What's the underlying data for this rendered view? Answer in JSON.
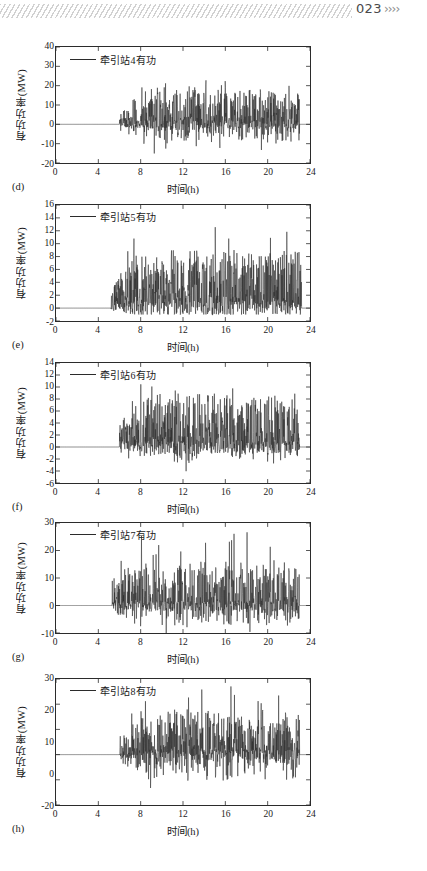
{
  "page": {
    "folio": "023",
    "chevrons": "››››",
    "hatch_name": "decorative-hatch-band"
  },
  "figure": {
    "xlabel": "时间(h)",
    "ylabel": "有功功率(MW)",
    "xticks": [
      "0",
      "4",
      "8",
      "12",
      "16",
      "20",
      "24"
    ],
    "panels": [
      {
        "tag": "(d)",
        "legend": "牵引站4有功",
        "yticks": [
          "40",
          "30",
          "20",
          "10",
          "0",
          "-10",
          "-20"
        ]
      },
      {
        "tag": "(e)",
        "legend": "牵引站5有功",
        "yticks": [
          "16",
          "14",
          "12",
          "10",
          "8",
          "6",
          "4",
          "2",
          "0",
          "-2"
        ]
      },
      {
        "tag": "(f)",
        "legend": "牵引站6有功",
        "yticks": [
          "14",
          "12",
          "10",
          "8",
          "6",
          "4",
          "2",
          "0",
          "-2",
          "-4",
          "-6"
        ]
      },
      {
        "tag": "(g)",
        "legend": "牵引站7有功",
        "yticks": [
          "30",
          "20",
          "10",
          "0",
          "-10"
        ]
      },
      {
        "tag": "(h)",
        "legend": "牵引站8有功",
        "yticks": [
          "30",
          "20",
          "10",
          "0",
          "-20"
        ]
      }
    ]
  },
  "chart_data": [
    {
      "type": "line",
      "id": "panel-d",
      "title": "",
      "label": "(d)",
      "xlabel": "时间(h)",
      "ylabel": "有功功率(MW)",
      "legend": [
        "牵引站4有功"
      ],
      "legend_position": "top-left-inside",
      "grid": false,
      "xlim": [
        0,
        24
      ],
      "ylim": [
        -20,
        40
      ],
      "xticks": [
        0,
        4,
        8,
        12,
        16,
        20,
        24
      ],
      "yticks": [
        -20,
        -10,
        0,
        10,
        20,
        30,
        40
      ],
      "series": [
        {
          "name": "牵引站4有功",
          "color": "#2b2b2b",
          "note": "Flat at 0 MW from 0h to ~6h; bursty traction load 6h-23h; peaks ~28 MW near 9.5h and ~25 MW near 12.3h; troughs to about -17 MW; returns to ~0 after 23h",
          "quiet_interval": [
            0,
            6
          ],
          "active_interval": [
            6,
            23
          ],
          "peak_value": 28,
          "min_value": -17,
          "typical_band": [
            -10,
            20
          ]
        }
      ]
    },
    {
      "type": "line",
      "id": "panel-e",
      "title": "",
      "label": "(e)",
      "xlabel": "时间(h)",
      "ylabel": "有功功率(MW)",
      "legend": [
        "牵引站5有功"
      ],
      "legend_position": "top-left-inside",
      "grid": false,
      "xlim": [
        0,
        24
      ],
      "ylim": [
        -2,
        16
      ],
      "xticks": [
        0,
        4,
        8,
        12,
        16,
        20,
        24
      ],
      "yticks": [
        -2,
        0,
        2,
        4,
        6,
        8,
        10,
        12,
        14,
        16
      ],
      "series": [
        {
          "name": "牵引站5有功",
          "color": "#2b2b2b",
          "note": "Flat at 0 MW until ~5.2h; isolated spikes 5-8h reaching 4-6 MW; dense activity 8.5h-23h; maxima ~14.2 MW near 11.5h and ~14.2 MW near 22h; mostly positive, minimum near -1 MW",
          "quiet_interval": [
            0,
            5.2
          ],
          "active_interval": [
            5.2,
            23.2
          ],
          "peak_value": 14.2,
          "min_value": -1,
          "typical_band": [
            0,
            10
          ]
        }
      ]
    },
    {
      "type": "line",
      "id": "panel-f",
      "title": "",
      "label": "(f)",
      "xlabel": "时间(h)",
      "ylabel": "有功功率(MW)",
      "legend": [
        "牵引站6有功"
      ],
      "legend_position": "top-left-inside",
      "grid": false,
      "xlim": [
        0,
        24
      ],
      "ylim": [
        -6,
        14
      ],
      "xticks": [
        0,
        4,
        8,
        12,
        16,
        20,
        24
      ],
      "yticks": [
        -6,
        -4,
        -2,
        0,
        2,
        4,
        6,
        8,
        10,
        12,
        14
      ],
      "series": [
        {
          "name": "牵引站6有功",
          "color": "#2b2b2b",
          "note": "Flat at 0 MW until ~6h; small bumps 6-8h up to ~4.5 MW; heavy fluctuation 8.5h-23h; peak ~13 MW near 12.6h; deepest trough about -4.5 MW near 15h",
          "quiet_interval": [
            0,
            6
          ],
          "active_interval": [
            6,
            23
          ],
          "peak_value": 13,
          "min_value": -4.5,
          "typical_band": [
            -2,
            10
          ]
        }
      ]
    },
    {
      "type": "line",
      "id": "panel-g",
      "title": "",
      "label": "(g)",
      "xlabel": "时间(h)",
      "ylabel": "有功功率(MW)",
      "legend": [
        "牵引站7有功"
      ],
      "legend_position": "top-left-inside",
      "grid": false,
      "xlim": [
        0,
        24
      ],
      "ylim": [
        -10,
        30
      ],
      "xticks": [
        0,
        4,
        8,
        12,
        16,
        20,
        24
      ],
      "yticks": [
        -10,
        0,
        10,
        20,
        30
      ],
      "series": [
        {
          "name": "牵引站7有功",
          "color": "#2b2b2b",
          "note": "Flat at 0 MW until ~5.3h; isolated spike ~6 MW at 5.4h, dips to -6 MW near 6.2h; dense load 8h-23h; tallest peak ~31 MW near 11.6h; troughs to about -11 MW",
          "quiet_interval": [
            0,
            5.3
          ],
          "active_interval": [
            5.3,
            23
          ],
          "peak_value": 31,
          "min_value": -11,
          "typical_band": [
            -8,
            18
          ]
        }
      ]
    },
    {
      "type": "line",
      "id": "panel-h",
      "title": "",
      "label": "(h)",
      "xlabel": "时间(h)",
      "ylabel": "有功功率(MW)",
      "legend": [
        "牵引站8有功"
      ],
      "legend_position": "top-left-inside",
      "grid": false,
      "xlim": [
        0,
        24
      ],
      "ylim": [
        -20,
        30
      ],
      "xticks": [
        0,
        4,
        8,
        12,
        16,
        20,
        24
      ],
      "yticks": [
        -20,
        -10,
        0,
        10,
        20,
        30
      ],
      "series": [
        {
          "name": "牵引站8有功",
          "color": "#2b2b2b",
          "note": "Flat at 0 MW until ~6h; spike to ~13 MW at 6.4h then dip to -7 MW; dense traction load 8.3h-23h; maximum ~31 MW near 15.5h; secondary peak ~25 MW near 13h; minimum about -16 MW near 12.5h",
          "quiet_interval": [
            0,
            6
          ],
          "active_interval": [
            6,
            23
          ],
          "peak_value": 31,
          "min_value": -16,
          "typical_band": [
            -10,
            20
          ]
        }
      ]
    }
  ]
}
